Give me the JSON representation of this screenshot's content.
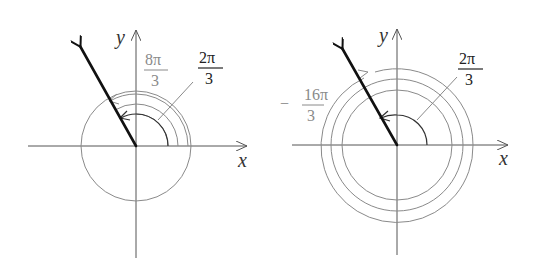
{
  "figures": [
    {
      "id": "left",
      "axes": {
        "x_label": "x",
        "y_label": "y"
      },
      "terminal_side_angle": "2π/3",
      "labels": [
        {
          "name": "angle-2pi-3",
          "numerator": "2π",
          "denominator": "3",
          "sign": "",
          "style": "dark"
        },
        {
          "name": "angle-8pi-3",
          "numerator": "8π",
          "denominator": "3",
          "sign": "",
          "style": "gray"
        }
      ]
    },
    {
      "id": "right",
      "axes": {
        "x_label": "x",
        "y_label": "y"
      },
      "terminal_side_angle": "2π/3",
      "labels": [
        {
          "name": "angle-2pi-3",
          "numerator": "2π",
          "denominator": "3",
          "sign": "",
          "style": "dark"
        },
        {
          "name": "angle-neg-16pi-3",
          "numerator": "16π",
          "denominator": "3",
          "sign": "−",
          "style": "gray"
        }
      ]
    }
  ],
  "colors": {
    "vector": "#111111",
    "axis": "#555555",
    "coterminal_arc": "#8a8a8a",
    "principal_arc": "#333333"
  }
}
